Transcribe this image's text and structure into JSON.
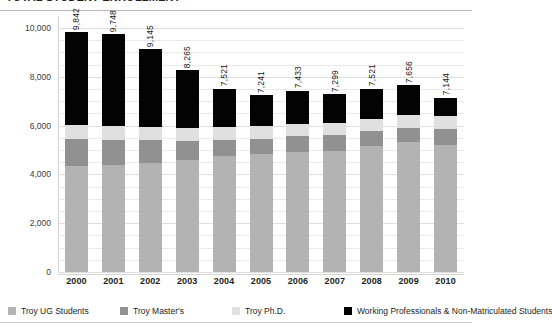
{
  "title": "TOTAL STUDENT ENROLLMENT",
  "chart_data": {
    "type": "bar",
    "subtype": "stacked-column",
    "title": "TOTAL STUDENT ENROLLMENT",
    "xlabel": "",
    "ylabel": "",
    "ylim": [
      0,
      10000
    ],
    "yticks": [
      "0",
      "2,000",
      "4,000",
      "6,000",
      "8,000",
      "10,000"
    ],
    "ytick_values": [
      0,
      2000,
      4000,
      6000,
      8000,
      10000
    ],
    "grid": true,
    "grid_minor_step": 500,
    "legend_position": "bottom",
    "categories": [
      "2000",
      "2001",
      "2002",
      "2003",
      "2004",
      "2005",
      "2006",
      "2007",
      "2008",
      "2009",
      "2010"
    ],
    "totals": [
      9842,
      9748,
      9145,
      8265,
      7521,
      7241,
      7433,
      7299,
      7521,
      7656,
      7144
    ],
    "total_labels": [
      "9,842",
      "9,748",
      "9,145",
      "8,265",
      "7,521",
      "7,241",
      "7,433",
      "7,299",
      "7,521",
      "7,656",
      "7,144"
    ],
    "series": [
      {
        "name": "Troy UG Students",
        "color": "#b3b3b3",
        "values": [
          4350,
          4380,
          4450,
          4600,
          4750,
          4830,
          4900,
          4960,
          5150,
          5320,
          5200
        ]
      },
      {
        "name": "Troy Master's",
        "color": "#919191",
        "values": [
          1100,
          1030,
          950,
          780,
          680,
          640,
          660,
          640,
          620,
          600,
          660
        ]
      },
      {
        "name": "Troy Ph.D.",
        "color": "#e0e0e0",
        "values": [
          570,
          560,
          545,
          520,
          510,
          500,
          505,
          500,
          500,
          520,
          520
        ]
      },
      {
        "name": "Working Professionals & Non-Matriculated Students",
        "color": "#030303",
        "values": [
          3822,
          3778,
          3200,
          2365,
          1581,
          1271,
          1368,
          1199,
          1251,
          1216,
          764
        ]
      }
    ]
  },
  "legend": {
    "items": [
      {
        "label": "Troy UG Students",
        "key": "ug"
      },
      {
        "label": "Troy Master's",
        "key": "ma"
      },
      {
        "label": "Troy Ph.D.",
        "key": "phd"
      },
      {
        "label": "Working Professionals & Non-Matriculated Students",
        "key": "wp"
      }
    ]
  }
}
